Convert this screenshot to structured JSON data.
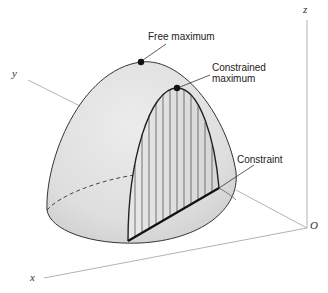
{
  "figure": {
    "type": "3d-surface-diagram",
    "colors": {
      "surface_fill": "#e2e2e2",
      "surface_shade": "#cfcfcf",
      "outline": "#333333",
      "axis": "#9a9a9a",
      "hatch": "#444444",
      "point": "#111111"
    }
  },
  "labels": {
    "free_maximum": "Free maximum",
    "constrained_maximum_line1": "Constrained",
    "constrained_maximum_line2": "maximum",
    "constraint": "Constraint"
  },
  "axes": {
    "x": "x",
    "y": "y",
    "z": "z",
    "origin": "O"
  }
}
